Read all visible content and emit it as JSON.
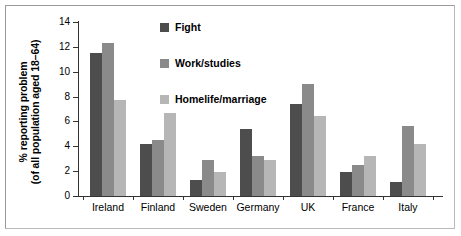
{
  "chart_data": {
    "type": "bar",
    "title": "",
    "xlabel": "",
    "ylabel": "% reporting problem (of all population aged 18–64)",
    "ylabel_line1": "% reporting problem",
    "ylabel_line2": "(of all population aged 18–64)",
    "categories": [
      "Ireland",
      "Finland",
      "Sweden",
      "Germany",
      "UK",
      "France",
      "Italy"
    ],
    "series": [
      {
        "name": "Fight",
        "color": "#4d4d4d",
        "values": [
          11.5,
          4.2,
          1.3,
          5.4,
          7.4,
          1.9,
          1.1
        ]
      },
      {
        "name": "Work/studies",
        "color": "#8a8a8a",
        "values": [
          12.3,
          4.5,
          2.9,
          3.2,
          9.0,
          2.5,
          5.6
        ]
      },
      {
        "name": "Homelife/marriage",
        "color": "#b6b6b6",
        "values": [
          7.7,
          6.7,
          1.9,
          2.9,
          6.4,
          3.2,
          4.2
        ]
      }
    ],
    "ylim": [
      0,
      14
    ],
    "yticks": [
      0,
      2,
      4,
      6,
      8,
      10,
      12,
      14
    ],
    "ytick_labels": [
      "0",
      "2",
      "4",
      "6",
      "8",
      "10",
      "12",
      "14"
    ],
    "grid": false,
    "legend_position": "inside-top-center"
  }
}
